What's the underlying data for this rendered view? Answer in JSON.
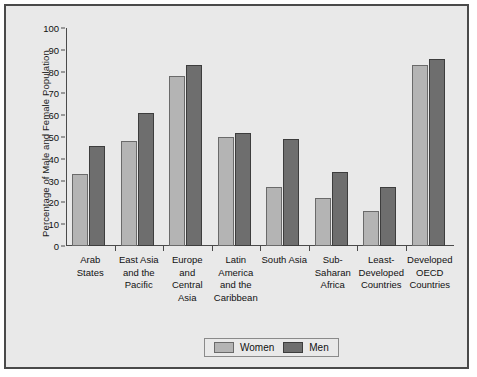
{
  "chart_data": {
    "type": "bar",
    "title": "",
    "xlabel": "",
    "ylabel": "Percentage of Male and Female Population",
    "ylim": [
      0,
      100
    ],
    "ytick_step": 10,
    "yticks": [
      100,
      90,
      80,
      70,
      60,
      50,
      40,
      30,
      20,
      10,
      0
    ],
    "grid": false,
    "legend_position": "bottom-center",
    "categories": [
      "Arab States",
      "East Asia and the Pacific",
      "Europe and Central Asia",
      "Latin America and the Caribbean",
      "South Asia",
      "Sub-Saharan Africa",
      "Least-Developed Countries",
      "Developed OECD Countries"
    ],
    "category_lines": [
      [
        "Arab",
        "States"
      ],
      [
        "East Asia",
        "and the",
        "Pacific"
      ],
      [
        "Europe",
        "and",
        "Central",
        "Asia"
      ],
      [
        "Latin",
        "America",
        "and the",
        "Caribbean"
      ],
      [
        "South Asia"
      ],
      [
        "Sub-",
        "Saharan",
        "Africa"
      ],
      [
        "Least-",
        "Developed",
        "Countries"
      ],
      [
        "Developed",
        "OECD",
        "Countries"
      ]
    ],
    "series": [
      {
        "name": "Women",
        "color": "#b4b4b4",
        "values": [
          33,
          48,
          78,
          50,
          27,
          22,
          16,
          83
        ]
      },
      {
        "name": "Men",
        "color": "#6e6e6e",
        "values": [
          46,
          61,
          83,
          52,
          49,
          34,
          27,
          86
        ]
      }
    ]
  },
  "legend": {
    "women_label": "Women",
    "men_label": "Men"
  }
}
